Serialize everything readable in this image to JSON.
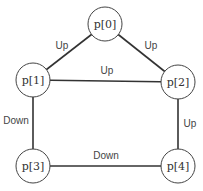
{
  "diagram": {
    "type": "graph",
    "nodes": [
      {
        "id": "p0",
        "label": "p[0]"
      },
      {
        "id": "p1",
        "label": "p[1]"
      },
      {
        "id": "p2",
        "label": "p[2]"
      },
      {
        "id": "p3",
        "label": "p[3]"
      },
      {
        "id": "p4",
        "label": "p[4]"
      }
    ],
    "edges": [
      {
        "from": "p0",
        "to": "p1",
        "label": "Up"
      },
      {
        "from": "p0",
        "to": "p2",
        "label": "Up"
      },
      {
        "from": "p1",
        "to": "p2",
        "label": "Up"
      },
      {
        "from": "p1",
        "to": "p3",
        "label": "Down"
      },
      {
        "from": "p2",
        "to": "p4",
        "label": "Up"
      },
      {
        "from": "p3",
        "to": "p4",
        "label": "Down"
      }
    ]
  }
}
